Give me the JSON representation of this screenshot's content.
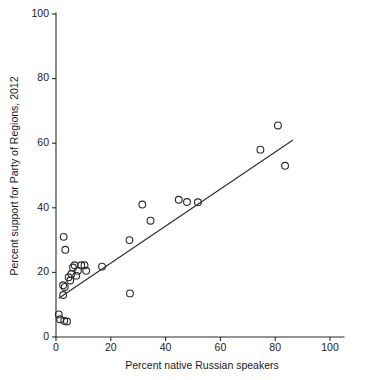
{
  "chart_data": {
    "type": "scatter",
    "title": "",
    "xlabel": "Percent native Russian speakers",
    "ylabel": "Percent support for Party of Regions, 2012",
    "xlim": [
      0,
      110
    ],
    "ylim": [
      0,
      100
    ],
    "xticks": [
      0,
      20,
      40,
      60,
      80,
      100
    ],
    "yticks": [
      0,
      20,
      40,
      60,
      80,
      100
    ],
    "xtick_labels": [
      "0",
      "20",
      "40",
      "60",
      "80",
      "100"
    ],
    "ytick_labels": [
      "0",
      "20",
      "40",
      "60",
      "80",
      "100"
    ],
    "grid": false,
    "legend": null,
    "marker": "open-circle",
    "marker_color": "#2b2b2b",
    "points": [
      {
        "x": 1.0,
        "y": 7.0
      },
      {
        "x": 1.5,
        "y": 5.5
      },
      {
        "x": 3.0,
        "y": 5.0
      },
      {
        "x": 4.0,
        "y": 4.8
      },
      {
        "x": 2.8,
        "y": 31.0
      },
      {
        "x": 3.4,
        "y": 27.0
      },
      {
        "x": 2.6,
        "y": 13.0
      },
      {
        "x": 2.6,
        "y": 16.0
      },
      {
        "x": 3.2,
        "y": 15.5
      },
      {
        "x": 4.6,
        "y": 18.5
      },
      {
        "x": 5.2,
        "y": 17.5
      },
      {
        "x": 5.6,
        "y": 19.5
      },
      {
        "x": 6.2,
        "y": 21.5
      },
      {
        "x": 6.8,
        "y": 22.2
      },
      {
        "x": 7.4,
        "y": 19.0
      },
      {
        "x": 8.0,
        "y": 20.5
      },
      {
        "x": 9.2,
        "y": 22.2
      },
      {
        "x": 10.4,
        "y": 22.2
      },
      {
        "x": 11.0,
        "y": 20.5
      },
      {
        "x": 16.8,
        "y": 21.8
      },
      {
        "x": 26.8,
        "y": 30.0
      },
      {
        "x": 27.0,
        "y": 13.5
      },
      {
        "x": 31.5,
        "y": 41.0
      },
      {
        "x": 34.5,
        "y": 36.0
      },
      {
        "x": 44.8,
        "y": 42.5
      },
      {
        "x": 47.8,
        "y": 41.8
      },
      {
        "x": 51.8,
        "y": 41.7
      },
      {
        "x": 74.6,
        "y": 58.0
      },
      {
        "x": 81.0,
        "y": 65.5
      },
      {
        "x": 83.6,
        "y": 53.0
      }
    ],
    "fit_line": {
      "type": "linear-regression",
      "x_start": 1.0,
      "y_start": 12.0,
      "x_end": 86.5,
      "y_end": 61.0
    }
  }
}
